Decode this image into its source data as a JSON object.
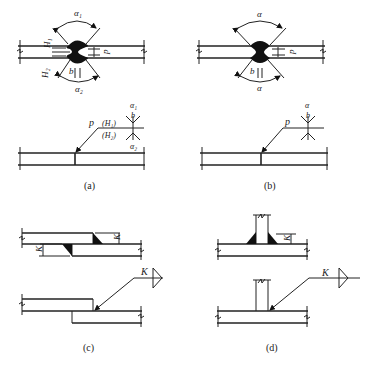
{
  "figure": {
    "panels": [
      {
        "id": "a",
        "caption": "(a)",
        "description": "Double-V groove butt weld with unequal depths",
        "labels": {
          "alpha_top": "α₁",
          "alpha_bottom": "α₂",
          "H_top": "H₁",
          "H_bottom": "H₂",
          "gap": "b",
          "root": "p",
          "symbol_p": "p",
          "symbol_H1": "(H₁)",
          "symbol_H2": "(H₂)",
          "symbol_alpha_top": "α₁",
          "symbol_b": "b",
          "symbol_alpha_bottom": "α₂"
        }
      },
      {
        "id": "b",
        "caption": "(b)",
        "description": "Double-V groove butt weld with equal depths",
        "labels": {
          "alpha_top": "α",
          "alpha_bottom": "α",
          "gap": "b",
          "root": "p",
          "symbol_p": "p",
          "symbol_alpha": "α",
          "symbol_b": "b"
        }
      },
      {
        "id": "c",
        "caption": "(c)",
        "description": "Lap joint with fillet welds",
        "labels": {
          "leg_top": "K",
          "leg_bottom": "K",
          "symbol_K": "K"
        }
      },
      {
        "id": "d",
        "caption": "(d)",
        "description": "T-joint with double fillet welds",
        "labels": {
          "leg": "K",
          "symbol_K": "K"
        }
      }
    ],
    "colors": {
      "line": "#222222",
      "fill": "#111111",
      "background": "#ffffff"
    }
  }
}
